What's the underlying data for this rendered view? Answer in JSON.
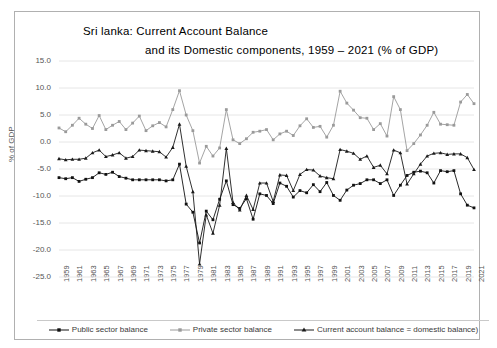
{
  "chart": {
    "title_line1": "Sri lanka: Current Account Balance",
    "title_line2": "and its Domestic components, 1959 – 2021 (% of GDP)",
    "ylabel": "% of GDP",
    "border_color": "#b0b0b0",
    "grid_color": "#e6e6e6"
  },
  "legend": {
    "items": [
      {
        "label": "Public sector balance",
        "color": "#111111",
        "marker": "square"
      },
      {
        "label": "Private sector balance",
        "color": "#9a9a9a",
        "marker": "square"
      },
      {
        "label": "Current account balance = domestic balance)",
        "color": "#1a1a1a",
        "marker": "triangle"
      }
    ]
  },
  "chart_data": {
    "type": "line",
    "title": "Sri lanka: Current Account Balance and its Domestic components, 1959 – 2021 (% of GDP)",
    "xlabel": "",
    "ylabel": "% of GDP",
    "ylim": [
      -25.0,
      15.0
    ],
    "ytick_labels": [
      "15.0",
      "10.0",
      "5.0",
      "0.0",
      "-5.0",
      "-10.0",
      "-15.0",
      "-20.0",
      "-25.0"
    ],
    "ytick_values": [
      15.0,
      10.0,
      5.0,
      0.0,
      -5.0,
      -10.0,
      -15.0,
      -20.0,
      -25.0
    ],
    "grid": true,
    "legend_position": "bottom",
    "x": [
      1959,
      1960,
      1961,
      1962,
      1963,
      1964,
      1965,
      1966,
      1967,
      1968,
      1969,
      1970,
      1971,
      1972,
      1973,
      1974,
      1975,
      1976,
      1977,
      1978,
      1979,
      1980,
      1981,
      1982,
      1983,
      1984,
      1985,
      1986,
      1987,
      1988,
      1989,
      1990,
      1991,
      1992,
      1993,
      1994,
      1995,
      1996,
      1997,
      1998,
      1999,
      2000,
      2001,
      2002,
      2003,
      2004,
      2005,
      2006,
      2007,
      2008,
      2009,
      2010,
      2011,
      2012,
      2013,
      2014,
      2015,
      2016,
      2017,
      2018,
      2019,
      2020,
      2021
    ],
    "xtick_labels": [
      "1959",
      "1961",
      "1963",
      "1965",
      "1967",
      "1969",
      "1971",
      "1973",
      "1975",
      "1977",
      "1979",
      "1981",
      "1983",
      "1985",
      "1987",
      "1989",
      "1991",
      "1993",
      "1995",
      "1997",
      "1999",
      "2001",
      "2003",
      "2005",
      "2007",
      "2009",
      "2011",
      "2013",
      "2015",
      "2017",
      "2019",
      "2021"
    ],
    "series": [
      {
        "name": "Public sector balance",
        "color": "#111111",
        "marker": "square",
        "values": [
          -6.6,
          -6.8,
          -6.6,
          -7.3,
          -6.9,
          -6.6,
          -5.7,
          -6.0,
          -5.6,
          -6.4,
          -6.7,
          -7.0,
          -7.0,
          -7.0,
          -7.0,
          -7.0,
          -7.2,
          -7.0,
          -4.1,
          -11.5,
          -13.0,
          -18.7,
          -12.8,
          -14.4,
          -10.6,
          -7.2,
          -11.6,
          -12.3,
          -10.5,
          -14.3,
          -9.6,
          -9.9,
          -11.4,
          -7.6,
          -8.2,
          -10.2,
          -9.0,
          -9.4,
          -7.9,
          -9.2,
          -7.5,
          -9.9,
          -10.8,
          -8.9,
          -8.0,
          -7.7,
          -7.0,
          -7.0,
          -7.7,
          -7.0,
          -9.9,
          -8.0,
          -6.2,
          -5.6,
          -5.4,
          -5.7,
          -7.6,
          -5.3,
          -5.5,
          -5.3,
          -9.6,
          -11.7,
          -12.2
        ]
      },
      {
        "name": "Private sector balance",
        "color": "#9a9a9a",
        "marker": "square",
        "values": [
          2.6,
          1.9,
          3.1,
          4.4,
          3.3,
          2.5,
          4.9,
          2.3,
          3.1,
          3.8,
          2.3,
          3.5,
          4.8,
          2.1,
          3.0,
          3.6,
          2.8,
          6.0,
          9.5,
          5.0,
          2.1,
          -3.9,
          -0.8,
          -2.6,
          -1.1,
          6.0,
          0.4,
          -0.3,
          0.6,
          1.8,
          2.0,
          2.3,
          0.4,
          1.5,
          2.0,
          1.2,
          3.0,
          4.3,
          2.7,
          2.9,
          0.9,
          3.1,
          9.4,
          7.2,
          5.9,
          4.5,
          4.4,
          2.3,
          3.4,
          1.1,
          8.4,
          6.0,
          -1.6,
          -0.3,
          1.3,
          3.1,
          5.5,
          3.3,
          3.2,
          3.1,
          7.4,
          8.8,
          7.1
        ]
      },
      {
        "name": "Current account balance = domestic balance)",
        "color": "#1a1a1a",
        "marker": "triangle",
        "values": [
          -3.1,
          -3.3,
          -3.2,
          -3.2,
          -3.0,
          -2.0,
          -1.5,
          -2.7,
          -2.4,
          -2.0,
          -3.0,
          -2.7,
          -1.5,
          -1.6,
          -1.7,
          -1.8,
          -2.8,
          -1.0,
          3.3,
          -4.5,
          -9.2,
          -22.6,
          -13.5,
          -16.9,
          -11.7,
          -1.2,
          -11.2,
          -12.6,
          -9.9,
          -12.5,
          -7.6,
          -7.6,
          -11.0,
          -6.1,
          -6.2,
          -9.0,
          -6.0,
          -5.1,
          -5.2,
          -6.3,
          -6.6,
          -6.8,
          -1.4,
          -1.7,
          -2.1,
          -3.2,
          -2.6,
          -4.7,
          -4.3,
          -5.9,
          -1.5,
          -2.0,
          -7.8,
          -5.9,
          -4.1,
          -2.6,
          -2.1,
          -2.0,
          -2.3,
          -2.2,
          -2.2,
          -2.9,
          -5.1
        ]
      }
    ]
  }
}
